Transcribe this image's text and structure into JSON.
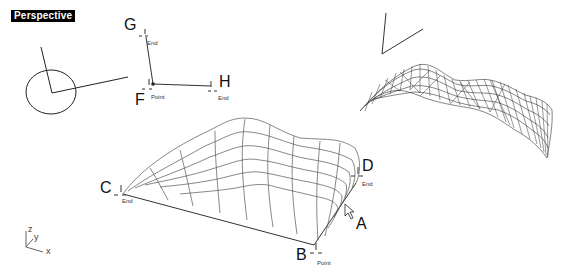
{
  "viewport": {
    "title": "Perspective",
    "background": "#ffffff",
    "label_bg": "#000000",
    "label_fg": "#ffffff"
  },
  "points": {
    "A": {
      "label": "A"
    },
    "B": {
      "label": "B",
      "snap": "Point"
    },
    "C": {
      "label": "C",
      "snap": "End"
    },
    "D": {
      "label": "D",
      "snap": "End"
    },
    "F": {
      "label": "F",
      "snap": "Point"
    },
    "G": {
      "label": "G",
      "snap": "End"
    },
    "H": {
      "label": "H",
      "snap": "End"
    }
  },
  "axes": {
    "x": "x",
    "y": "y",
    "z": "z"
  },
  "icons": {
    "cursor": "arrow-cursor-icon",
    "osnap": "osnap-marker-icon"
  }
}
